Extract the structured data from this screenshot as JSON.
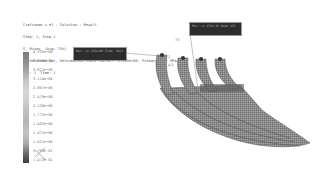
{
  "header": {
    "lines": [
      "Craftsman_s-el : Solution : Result",
      "Step: 1, Step-1",
      "S, Mises  (Avg: 75%)",
      "U: Deformed Var, Deformation Scale Factor: +1.225e+00, Primary Var: MPa",
      "Inc: 1  Time: 1"
    ]
  },
  "legend": {
    "title": "S, Mises",
    "values": [
      "4.335e+00",
      "3.870e+00",
      "3.621e+00",
      "3.114e+00",
      "2.807e+00",
      "2.470e+00",
      "2.128e+00",
      "1.772e+00",
      "1.432e+00",
      "1.071e+00",
      "1.021e+00",
      "5.793e-01",
      "1.472e-01"
    ]
  },
  "callouts": [
    {
      "id": "callout-max",
      "text": "Max: +4.335e+00  Elem: 1023"
    },
    {
      "id": "callout-min",
      "text": "Min: +1.472e-01  Node 415"
    }
  ],
  "annotations": {
    "angle_label": "75",
    "dim_a": "2",
    "dim_b": "4.5"
  },
  "colors": {
    "model_fill": "#8a8a8a",
    "model_dark": "#4a4a4a",
    "callout_bg": "#2d2d2d"
  }
}
